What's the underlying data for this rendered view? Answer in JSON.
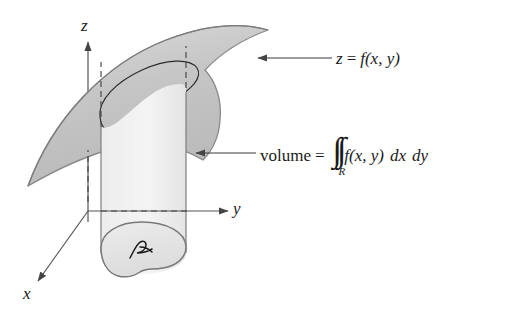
{
  "figure": {
    "background_color": "#ffffff",
    "ink_color": "#1a1a1a",
    "surface_fill_color": "#c8c8c8",
    "cylinder_fill_color": "#f0f0f0",
    "region_fill_color": "#e6e6e6",
    "outline_color": "#808080"
  },
  "axes": {
    "z_label": "z",
    "y_label": "y",
    "x_label": "x"
  },
  "labels": {
    "surface": {
      "z": "z",
      "equals": "=",
      "f": "f",
      "args": "(x, y)"
    },
    "volume": {
      "word": "volume",
      "equals": "=",
      "integral_signs": "∫∫",
      "integral_subscript": "R",
      "f": "f",
      "args": "(x, y)",
      "differentials_1": "dx",
      "differentials_2": "dy"
    },
    "region": {
      "name": "R"
    }
  },
  "icons": {
    "z_axis_arrow": "up-arrow-icon",
    "y_axis_arrow": "right-arrow-icon",
    "x_axis_arrow": "down-left-arrow-icon",
    "surface_leader_arrow": "left-arrow-icon",
    "volume_leader_arrow": "left-arrow-icon"
  }
}
